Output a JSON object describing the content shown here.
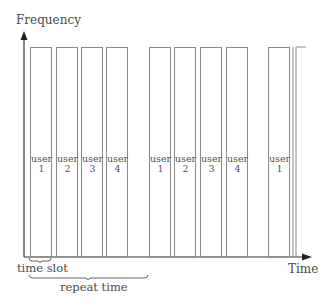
{
  "diagram": {
    "y_axis_label": "Frequency",
    "x_axis_label": "Time",
    "annotations": {
      "time_slot": "time slot",
      "repeat_time": "repeat time"
    },
    "slots": [
      {
        "user_word": "user",
        "user_num": "1",
        "x": 30,
        "w": 21
      },
      {
        "user_word": "user",
        "user_num": "2",
        "x": 56,
        "w": 21
      },
      {
        "user_word": "user",
        "user_num": "3",
        "x": 81,
        "w": 21
      },
      {
        "user_word": "user",
        "user_num": "4",
        "x": 106,
        "w": 21
      },
      {
        "user_word": "user",
        "user_num": "1",
        "x": 149,
        "w": 21
      },
      {
        "user_word": "user",
        "user_num": "2",
        "x": 174,
        "w": 21
      },
      {
        "user_word": "user",
        "user_num": "3",
        "x": 200,
        "w": 21
      },
      {
        "user_word": "user",
        "user_num": "4",
        "x": 226,
        "w": 21
      },
      {
        "user_word": "user",
        "user_num": "1",
        "x": 268,
        "w": 21
      }
    ],
    "colors": {
      "axis": "#333333",
      "bar_stroke": "#8a8a8a",
      "text": "#4a4a4a"
    }
  }
}
